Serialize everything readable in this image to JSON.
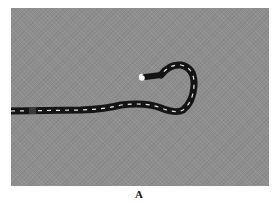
{
  "figure": {
    "caption": "A",
    "background_color": "#8e8e8e",
    "scope_color": "#141414",
    "marking_color": "#e8e8e8"
  }
}
